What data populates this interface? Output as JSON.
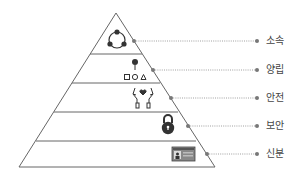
{
  "diagram": {
    "type": "pyramid",
    "colors": {
      "stroke": "#666666",
      "icon": "#333333",
      "dot": "#777777",
      "text": "#444444"
    },
    "levels": [
      {
        "label": "소속",
        "icon": "group-network-icon"
      },
      {
        "label": "양립",
        "icon": "hierarchy-shapes-icon"
      },
      {
        "label": "안전",
        "icon": "hands-heart-icon"
      },
      {
        "label": "보안",
        "icon": "padlock-icon"
      },
      {
        "label": "신분",
        "icon": "id-card-icon"
      }
    ]
  }
}
